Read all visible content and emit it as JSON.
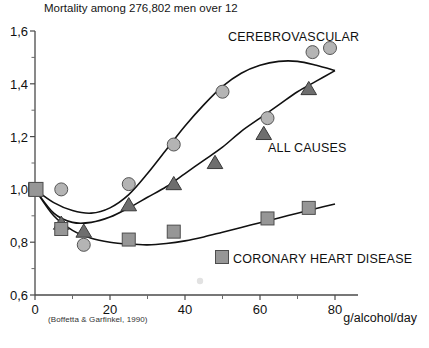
{
  "chart_data": {
    "type": "scatter",
    "title": "Mortality among 276,802 men over 12",
    "xlabel": "g/alcohol/day",
    "ylabel": "",
    "xlim": [
      0,
      80
    ],
    "ylim": [
      0.6,
      1.6
    ],
    "xticks": [
      0,
      20,
      40,
      60,
      80
    ],
    "xtick_labels": [
      "0",
      "20",
      "40",
      "60",
      "80"
    ],
    "xminor_ticks": [
      10,
      30,
      50,
      70
    ],
    "yticks": [
      0.6,
      0.8,
      1.0,
      1.2,
      1.4,
      1.6
    ],
    "ytick_labels": [
      "0,6",
      "0,8",
      "1,0",
      "1,2",
      "1,4",
      "1,6"
    ],
    "yminor_ticks": [
      0.7,
      0.9,
      1.1,
      1.3,
      1.5
    ],
    "grid": false,
    "legend_position": "inline-annotations",
    "source_note": "(Boffetta & Garfinkel, 1990)",
    "series": [
      {
        "name": "CEREBROVASCULAR",
        "marker": "circle",
        "color": "#b4b4b4",
        "edge_color": "#555555",
        "x": [
          7,
          13,
          25,
          37,
          50,
          62,
          74
        ],
        "y": [
          1.0,
          0.79,
          1.02,
          1.17,
          1.37,
          1.27,
          1.52
        ],
        "fit": [
          [
            0,
            1.0
          ],
          [
            5,
            0.95
          ],
          [
            10,
            0.92
          ],
          [
            15,
            0.91
          ],
          [
            20,
            0.93
          ],
          [
            25,
            0.98
          ],
          [
            30,
            1.06
          ],
          [
            35,
            1.15
          ],
          [
            40,
            1.24
          ],
          [
            45,
            1.32
          ],
          [
            50,
            1.39
          ],
          [
            55,
            1.44
          ],
          [
            60,
            1.47
          ],
          [
            65,
            1.485
          ],
          [
            70,
            1.485
          ],
          [
            75,
            1.47
          ],
          [
            80,
            1.45
          ]
        ]
      },
      {
        "name": "ALL CAUSES",
        "marker": "triangle",
        "color": "#6e6e6e",
        "edge_color": "#3a3a3a",
        "x": [
          7,
          13,
          25,
          37,
          48,
          61,
          73
        ],
        "y": [
          0.87,
          0.84,
          0.94,
          1.02,
          1.1,
          1.21,
          1.38
        ],
        "fit": [
          [
            0,
            1.0
          ],
          [
            5,
            0.91
          ],
          [
            10,
            0.875
          ],
          [
            15,
            0.875
          ],
          [
            20,
            0.895
          ],
          [
            25,
            0.93
          ],
          [
            30,
            0.97
          ],
          [
            35,
            1.01
          ],
          [
            40,
            1.06
          ],
          [
            45,
            1.11
          ],
          [
            50,
            1.16
          ],
          [
            55,
            1.22
          ],
          [
            60,
            1.27
          ],
          [
            65,
            1.32
          ],
          [
            70,
            1.37
          ],
          [
            75,
            1.41
          ],
          [
            80,
            1.45
          ]
        ]
      },
      {
        "name": "CORONARY HEART DISEASE",
        "marker": "square",
        "color": "#969696",
        "edge_color": "#4d4d4d",
        "x": [
          0,
          7,
          25,
          37,
          62,
          73
        ],
        "y": [
          1.0,
          0.85,
          0.81,
          0.84,
          0.89,
          0.93
        ],
        "fit": [
          [
            0,
            1.0
          ],
          [
            5,
            0.9
          ],
          [
            10,
            0.845
          ],
          [
            15,
            0.815
          ],
          [
            20,
            0.8
          ],
          [
            25,
            0.793
          ],
          [
            30,
            0.79
          ],
          [
            35,
            0.795
          ],
          [
            40,
            0.805
          ],
          [
            45,
            0.82
          ],
          [
            50,
            0.838
          ],
          [
            55,
            0.856
          ],
          [
            60,
            0.874
          ],
          [
            65,
            0.892
          ],
          [
            70,
            0.91
          ],
          [
            75,
            0.928
          ],
          [
            80,
            0.945
          ]
        ]
      }
    ],
    "annotations": [
      {
        "text": "CEREBROVASCULAR",
        "x_px": 228,
        "y_px": 31
      },
      {
        "text": "ALL CAUSES",
        "x_px": 268,
        "y_px": 142
      },
      {
        "text": "CORONARY HEART DISEASE",
        "x_px": 233,
        "y_px": 253
      }
    ]
  },
  "legend": {
    "cerebrovascular_marker": "circle-icon",
    "all_causes_marker": "triangle-icon",
    "coronary_marker": "square-icon"
  }
}
